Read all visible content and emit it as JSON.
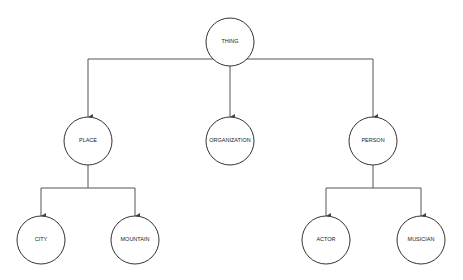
{
  "diagram": {
    "type": "tree",
    "colors": {
      "background": "#ffffff",
      "node_stroke": "#333333",
      "edge_stroke": "#555555",
      "label": "#222222"
    },
    "nodes": [
      {
        "id": "thing",
        "label": "THING",
        "cx": 230,
        "cy": 42,
        "r": 24
      },
      {
        "id": "place",
        "label": "PLACE",
        "cx": 88,
        "cy": 141,
        "r": 24
      },
      {
        "id": "organization",
        "label": "ORGANIZATION",
        "cx": 230,
        "cy": 141,
        "r": 24
      },
      {
        "id": "person",
        "label": "PERSON",
        "cx": 373,
        "cy": 141,
        "r": 24
      },
      {
        "id": "city",
        "label": "CITY",
        "cx": 41,
        "cy": 240,
        "r": 24
      },
      {
        "id": "mountain",
        "label": "MOUNTAIN",
        "cx": 135,
        "cy": 240,
        "r": 24
      },
      {
        "id": "actor",
        "label": "ACTOR",
        "cx": 326,
        "cy": 240,
        "r": 24
      },
      {
        "id": "musician",
        "label": "MUSICIAN",
        "cx": 421,
        "cy": 240,
        "r": 24
      }
    ],
    "edges": [
      {
        "from": "thing",
        "to": "place"
      },
      {
        "from": "thing",
        "to": "organization"
      },
      {
        "from": "thing",
        "to": "person"
      },
      {
        "from": "place",
        "to": "city"
      },
      {
        "from": "place",
        "to": "mountain"
      },
      {
        "from": "person",
        "to": "actor"
      },
      {
        "from": "person",
        "to": "musician"
      }
    ]
  }
}
